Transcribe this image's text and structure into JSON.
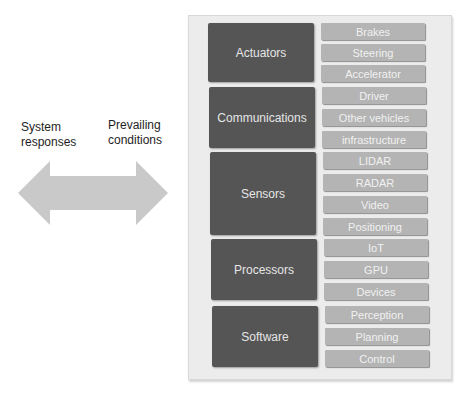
{
  "labels": {
    "left": [
      "System",
      "responses"
    ],
    "right": [
      "Prevailing",
      "conditions"
    ]
  },
  "arrow": {
    "type": "double-headed",
    "color": "#c9c9c9"
  },
  "colors": {
    "panel_bg": "#ececec",
    "dark_box": "#555555",
    "light_box": "#b4b4b4",
    "text_light": "#f1f1f1"
  },
  "groups": [
    {
      "name": "Actuators",
      "items": [
        "Brakes",
        "Steering",
        "Accelerator"
      ]
    },
    {
      "name": "Communications",
      "items": [
        "Driver",
        "Other vehicles",
        "infrastructure"
      ]
    },
    {
      "name": "Sensors",
      "items": [
        "LIDAR",
        "RADAR",
        "Video",
        "Positioning"
      ]
    },
    {
      "name": "Processors",
      "items": [
        "IoT",
        "GPU",
        "Devices"
      ]
    },
    {
      "name": "Software",
      "items": [
        "Perception",
        "Planning",
        "Control"
      ]
    }
  ]
}
